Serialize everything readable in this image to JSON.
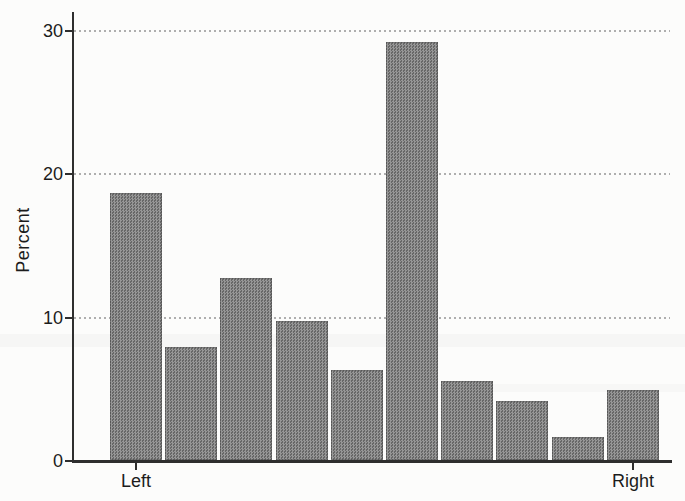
{
  "chart_data": {
    "type": "bar",
    "title": "",
    "xlabel": "",
    "ylabel": "Percent",
    "categories": [
      "1",
      "2",
      "3",
      "4",
      "5",
      "6",
      "7",
      "8",
      "9",
      "10"
    ],
    "values": [
      18.6,
      7.9,
      12.7,
      9.7,
      6.3,
      29.1,
      5.5,
      4.1,
      1.6,
      4.9
    ],
    "y_ticks": [
      0,
      10,
      20,
      30
    ],
    "ylim": [
      0,
      31.3
    ],
    "x_tick_labels": [
      {
        "label": "Left",
        "bar_index": 0
      },
      {
        "label": "Right",
        "bar_index": 9
      }
    ],
    "grid": "horizontal dotted lines at 10, 20, 30",
    "legend_position": "none",
    "bar_color": "#787878",
    "gridline_color": "#aeaeae",
    "axis_color": "#2e2e2e",
    "text_color": "#1c1c1c",
    "background": "#fcfcfb"
  }
}
